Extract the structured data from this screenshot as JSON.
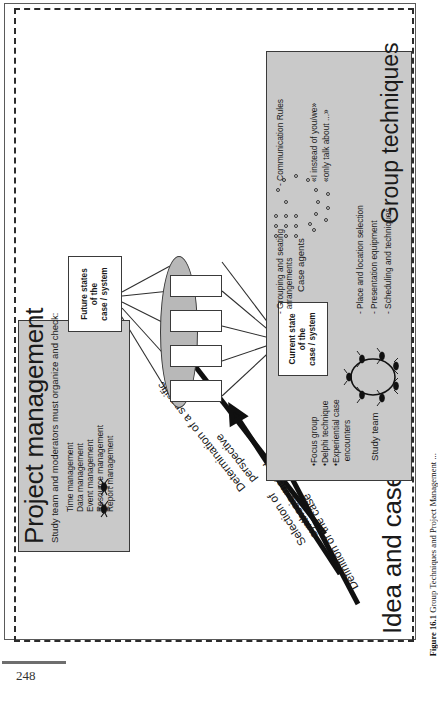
{
  "figure": {
    "main_title": "Idea and case analysis moderation",
    "caption_label": "Figure 16.1",
    "caption_text": "Group Techniques and Project Management ...",
    "page_number": "248"
  },
  "project_management": {
    "title": "Project management",
    "subtitle": "Study team and moderators must organize and check:",
    "items": [
      "Time management",
      "Data management",
      "Event management",
      "Resource management",
      "Report management"
    ]
  },
  "arrow_labels": [
    "Determination of a specific\nperspective",
    "Selection of\nsynthesis method",
    "Definition of the case"
  ],
  "boxes": {
    "future_state": "Future states\nof the\ncase / system",
    "current_state": "Current state\nof the\ncase / system"
  },
  "labels": {
    "case_agents": "Case agents",
    "study_team": "Study team"
  },
  "group_techniques": {
    "title": "Group techniques",
    "left_items": [
      "•Focus group",
      "•Delphi technique",
      "•Experiential case",
      "  encounters"
    ],
    "middle_items": [
      "- Place and location selection",
      "- Presentation equipment",
      "- Scheduling and techniques"
    ],
    "grouping_label": "- Grouping and seating\n  arrangements",
    "communication_title": "- Communication Rules",
    "communication_rules": [
      "«I instead of you/we»",
      "«only talk about ...»"
    ]
  },
  "colors": {
    "panel_fill": "#c9c9c9",
    "ellipse_fill": "#b8b8b8",
    "stroke": "#3a3a3a",
    "page_bg": "#ffffff"
  }
}
